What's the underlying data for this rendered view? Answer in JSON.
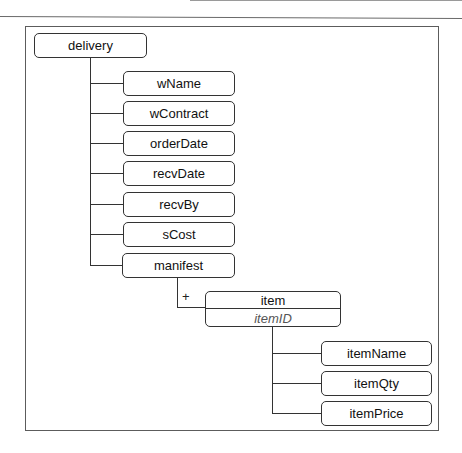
{
  "diagram": {
    "root": {
      "label": "delivery"
    },
    "children": [
      {
        "label": "wName"
      },
      {
        "label": "wContract"
      },
      {
        "label": "orderDate"
      },
      {
        "label": "recvDate"
      },
      {
        "label": "recvBy"
      },
      {
        "label": "sCost"
      },
      {
        "label": "manifest"
      }
    ],
    "manifest_child": {
      "label": "item",
      "key": "itemID",
      "cardinality": "+"
    },
    "item_children": [
      {
        "label": "itemName"
      },
      {
        "label": "itemQty"
      },
      {
        "label": "itemPrice"
      }
    ]
  }
}
